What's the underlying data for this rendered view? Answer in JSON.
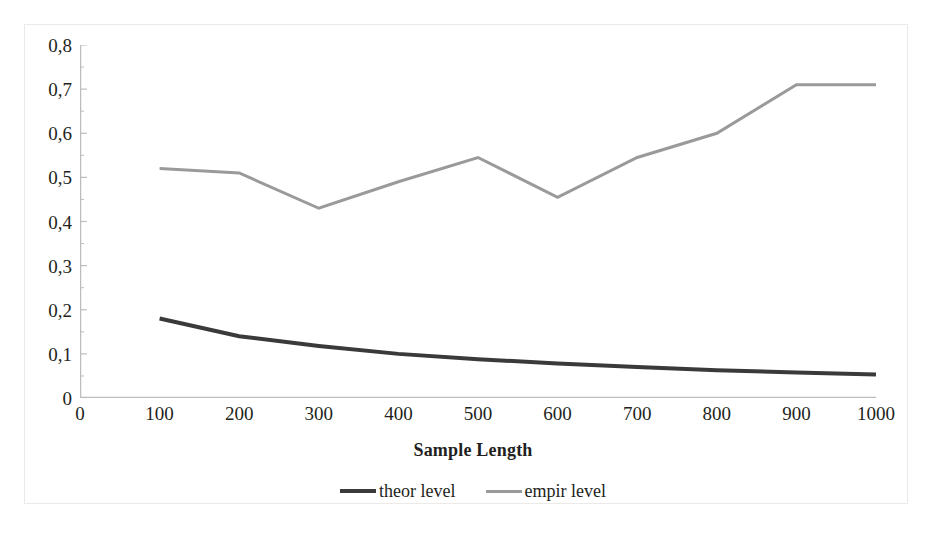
{
  "chart_data": {
    "type": "line",
    "title": "",
    "xlabel": "Sample Length",
    "ylabel": "",
    "xlim": [
      0,
      1000
    ],
    "ylim": [
      0,
      0.8
    ],
    "grid": false,
    "legend_position": "bottom",
    "x": [
      100,
      200,
      300,
      400,
      500,
      600,
      700,
      800,
      900,
      1000
    ],
    "xticks": [
      "0",
      "100",
      "200",
      "300",
      "400",
      "500",
      "600",
      "700",
      "800",
      "900",
      "1000"
    ],
    "xtick_values": [
      0,
      100,
      200,
      300,
      400,
      500,
      600,
      700,
      800,
      900,
      1000
    ],
    "yticks": [
      "0",
      "0,1",
      "0,2",
      "0,3",
      "0,4",
      "0,5",
      "0,6",
      "0,7",
      "0,8"
    ],
    "ytick_values": [
      0,
      0.1,
      0.2,
      0.3,
      0.4,
      0.5,
      0.6,
      0.7,
      0.8
    ],
    "series": [
      {
        "name": "theor level",
        "color": "#3a3a3a",
        "width": 4,
        "values": [
          0.18,
          0.14,
          0.118,
          0.1,
          0.088,
          0.078,
          0.07,
          0.063,
          0.058,
          0.053
        ]
      },
      {
        "name": "empir level",
        "color": "#9a9a9a",
        "width": 3,
        "values": [
          0.52,
          0.51,
          0.43,
          0.49,
          0.545,
          0.455,
          0.545,
          0.6,
          0.71,
          0.71
        ]
      }
    ]
  },
  "legend": {
    "items": [
      {
        "label": "theor level",
        "color": "#3a3a3a"
      },
      {
        "label": "empir level",
        "color": "#9a9a9a"
      }
    ]
  },
  "axes": {
    "x_title": "Sample Length",
    "axis_color": "#bdbdbd"
  }
}
